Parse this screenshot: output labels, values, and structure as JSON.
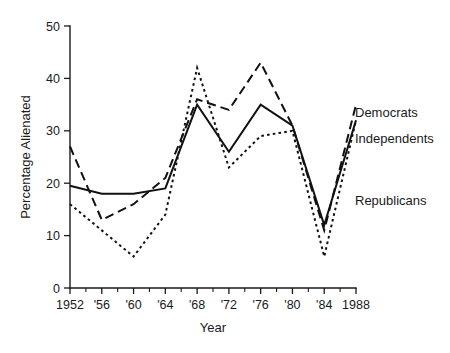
{
  "chart_data": {
    "type": "line",
    "title": "",
    "xlabel": "Year",
    "ylabel": "Percentage Alienated",
    "xlim": [
      1952,
      1988
    ],
    "ylim": [
      0,
      50
    ],
    "grid": false,
    "legend_position": "right-inline",
    "x": [
      1952,
      1956,
      1960,
      1964,
      1968,
      1972,
      1976,
      1980,
      1984,
      1988
    ],
    "x_tick_labels": [
      "1952",
      "'56",
      "'60",
      "'64",
      "'68",
      "'72",
      "'76",
      "'80",
      "'84",
      "1988"
    ],
    "y_ticks": [
      0,
      10,
      20,
      30,
      40,
      50
    ],
    "y_tick_labels": [
      "0",
      "10",
      "20",
      "30",
      "40",
      "50"
    ],
    "minor_x_ticks": [
      1954,
      1958,
      1962,
      1966,
      1970,
      1974,
      1978,
      1982,
      1986
    ],
    "series": [
      {
        "name": "Democrats",
        "style": "dashed",
        "values": [
          27,
          13,
          16,
          21,
          36,
          34,
          43,
          31,
          11,
          35
        ]
      },
      {
        "name": "Independents",
        "style": "solid",
        "values": [
          19.5,
          18,
          18,
          19,
          35,
          26,
          35,
          31,
          12,
          32
        ]
      },
      {
        "name": "Republicans",
        "style": "dotted",
        "values": [
          16,
          11,
          6,
          14,
          42,
          23,
          29,
          30,
          6,
          32
        ]
      }
    ]
  },
  "labels": {
    "democrats": "Democrats",
    "independents": "Independents",
    "republicans": "Republicans",
    "xlabel": "Year",
    "ylabel": "Percentage Alienated"
  },
  "y_tick_values": {
    "t0": "0",
    "t1": "10",
    "t2": "20",
    "t3": "30",
    "t4": "40",
    "t5": "50"
  },
  "x_tick_values": {
    "t0": "1952",
    "t1": "'56",
    "t2": "'60",
    "t3": "'64",
    "t4": "'68",
    "t5": "'72",
    "t6": "'76",
    "t7": "'80",
    "t8": "'84",
    "t9": "1988"
  },
  "colors": {
    "ink": "#1a1a1a",
    "background": "#ffffff"
  }
}
